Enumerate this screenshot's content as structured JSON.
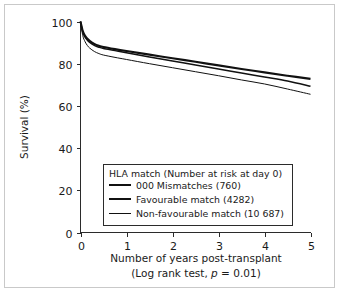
{
  "figure": {
    "title": "",
    "border_color": "#c9c9c9",
    "background": "#ffffff"
  },
  "axes": {
    "x_title": "Number of years post-transplant",
    "x_subtitle": "(Log rank test, p = 0.01)",
    "x_subtitle_prefix": "(Log rank test, ",
    "x_subtitle_italic": "p",
    "x_subtitle_suffix": " = 0.01)",
    "y_title": "Survival (%)",
    "x_ticks": [
      "0",
      "1",
      "2",
      "3",
      "4",
      "5"
    ],
    "y_ticks": [
      "0",
      "20",
      "40",
      "60",
      "80",
      "100"
    ]
  },
  "legend": {
    "header": "HLA match (Number at risk at day 0)",
    "entries": [
      {
        "label": "000 Mismatches (760)",
        "stroke_width": 2.1,
        "color": "#111111"
      },
      {
        "label": "Favourable match (4282)",
        "stroke_width": 1.5,
        "color": "#111111"
      },
      {
        "label": "Non-favourable match (10 687)",
        "stroke_width": 1.0,
        "color": "#111111"
      }
    ]
  },
  "chart_data": {
    "type": "line",
    "title": "",
    "subtitle": "",
    "xlabel": "Number of years post-transplant",
    "ylabel": "Survival (%)",
    "annotation": "(Log rank test, p = 0.01)",
    "xlim": [
      0,
      5
    ],
    "ylim": [
      0,
      100
    ],
    "xticks": [
      0,
      1,
      2,
      3,
      4,
      5
    ],
    "yticks": [
      0,
      20,
      40,
      60,
      80,
      100
    ],
    "grid": false,
    "legend_position": "lower-center",
    "x": [
      0,
      0.05,
      0.1,
      0.15,
      0.2,
      0.3,
      0.4,
      0.5,
      0.75,
      1,
      1.5,
      2,
      2.5,
      3,
      3.5,
      4,
      4.5,
      5
    ],
    "series": [
      {
        "name": "000 Mismatches (760)",
        "n_at_risk_day0": 760,
        "stroke_width": 2.1,
        "values": [
          100,
          95.5,
          93.2,
          91.8,
          90.8,
          89.4,
          88.5,
          87.9,
          86.9,
          86.0,
          84.3,
          82.6,
          80.9,
          79.2,
          77.5,
          75.9,
          74.3,
          72.8
        ]
      },
      {
        "name": "Favourable match (4282)",
        "n_at_risk_day0": 4282,
        "stroke_width": 1.5,
        "values": [
          100,
          95.0,
          92.6,
          91.1,
          90.1,
          88.7,
          87.8,
          87.2,
          86.2,
          85.2,
          83.2,
          81.3,
          79.4,
          77.5,
          75.6,
          73.7,
          71.8,
          69.3
        ]
      },
      {
        "name": "Non-favourable match (10 687)",
        "n_at_risk_day0": 10687,
        "stroke_width": 1.0,
        "values": [
          100,
          93.3,
          90.4,
          88.6,
          87.4,
          85.8,
          84.8,
          84.1,
          83.0,
          82.0,
          80.0,
          78.1,
          76.2,
          74.3,
          72.3,
          70.4,
          68.0,
          65.5
        ]
      }
    ]
  }
}
